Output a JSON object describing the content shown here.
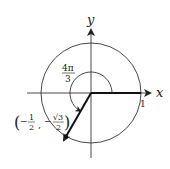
{
  "diagram": {
    "type": "unit-circle-angle",
    "axes": {
      "x_label": "x",
      "y_label": "y"
    },
    "radius_label": "1",
    "angle_label": {
      "numerator": "4π",
      "denominator": "3"
    },
    "point_label": {
      "open": "(",
      "x_sign": "−",
      "x_num": "1",
      "x_den": "2",
      "comma": ",",
      "y_sign": "−",
      "y_num": "√3",
      "y_den": "2",
      "close": ")"
    },
    "angle_degrees": 240,
    "colors": {
      "ink": "#222222",
      "background": "#ffffff"
    }
  }
}
